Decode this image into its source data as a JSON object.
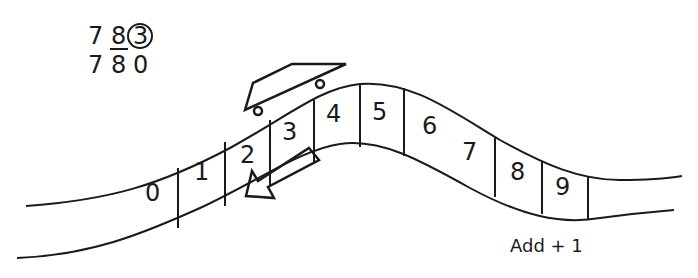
{
  "problem": {
    "line1": [
      "7",
      "8",
      "3"
    ],
    "line2": [
      "7",
      "8",
      "0"
    ],
    "underlined_digit": "8",
    "circled_digit": "3"
  },
  "number_line": {
    "cells": [
      "0",
      "1",
      "2",
      "3",
      "4",
      "5",
      "6",
      "7",
      "8",
      "9"
    ]
  },
  "caption": "Add + 1",
  "icons": {
    "cart": "roller-coaster-cart-icon",
    "arrow": "left-down-arrow-icon"
  },
  "colors": {
    "ink": "#1a1a1a",
    "background": "#ffffff"
  }
}
